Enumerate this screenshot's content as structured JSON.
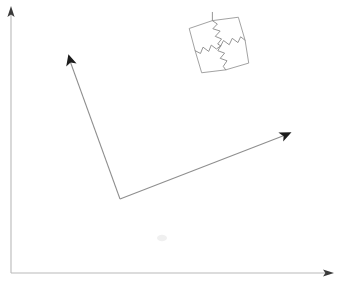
{
  "figure": {
    "title": "",
    "background_color": "#ffffff",
    "width": 337,
    "height": 287
  },
  "axes": {
    "name": "coordinate-axes",
    "color": "#b9b9b9",
    "arrowhead_color": "#3a3a3a",
    "origin": [
      11,
      273
    ],
    "y_axis": {
      "label": "",
      "from": [
        11,
        273
      ],
      "to": [
        11,
        10
      ]
    },
    "x_axis": {
      "label": "",
      "from": [
        11,
        273
      ],
      "to": [
        330,
        273
      ]
    }
  },
  "vectors": [
    {
      "name": "upper-left-vector",
      "label": "",
      "color": "#8e8e8e",
      "arrowhead_color": "#1d1d1d",
      "from": [
        120,
        199
      ],
      "to": [
        69,
        57
      ]
    },
    {
      "name": "right-vector",
      "label": "",
      "color": "#8e8e8e",
      "arrowhead_color": "#1d1d1d",
      "from": [
        120,
        199
      ],
      "to": [
        288,
        134
      ]
    }
  ],
  "puzzle": {
    "name": "rotated-puzzle-square",
    "label": "",
    "outline_color": "#9a9a9a",
    "cut_color": "#8c8c8c",
    "rotation_degrees": -14,
    "center": [
      220,
      45
    ],
    "size": 48,
    "pieces": 4
  },
  "annotations": {
    "smudge": {
      "name": "faint-smudge",
      "position": [
        162,
        238
      ]
    }
  }
}
